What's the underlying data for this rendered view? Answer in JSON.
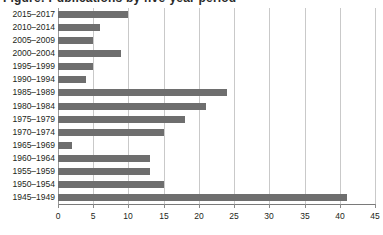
{
  "header": {
    "title_clipped": "Figure: Publications by five-year period"
  },
  "chart_data": {
    "type": "bar",
    "orientation": "horizontal",
    "title": "",
    "xlabel": "",
    "ylabel": "",
    "xlim": [
      0,
      45
    ],
    "ylim": null,
    "grid": true,
    "legend": null,
    "bar_color": "#6e6e6e",
    "gridline_color": "#c9c9c9",
    "axis_color": "#7a7a7a",
    "xticks": [
      0,
      5,
      10,
      15,
      20,
      25,
      30,
      35,
      40,
      45
    ],
    "categories": [
      "2015–2017",
      "2010–2014",
      "2005–2009",
      "2000–2004",
      "1995–1999",
      "1990–1994",
      "1985–1989",
      "1980–1984",
      "1975–1979",
      "1970–1974",
      "1965–1969",
      "1960–1964",
      "1955–1959",
      "1950–1954",
      "1945–1949"
    ],
    "values": [
      10,
      6,
      5,
      9,
      5,
      4,
      24,
      21,
      18,
      15,
      2,
      13,
      13,
      15,
      41
    ]
  }
}
